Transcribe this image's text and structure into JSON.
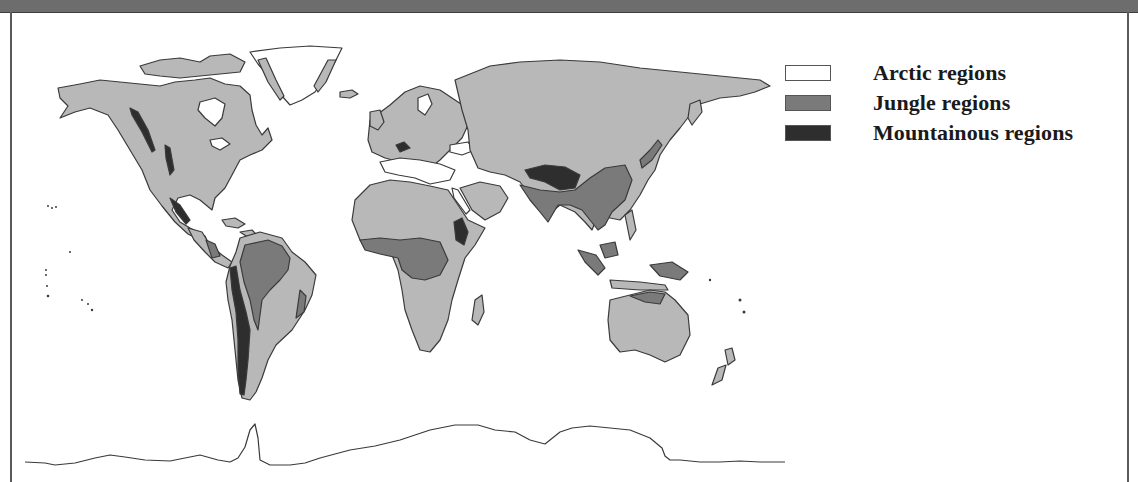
{
  "map": {
    "type": "world-climate-regions",
    "colors": {
      "land": "#b8b8b8",
      "arctic": "#ffffff",
      "jungle": "#7a7a7a",
      "mountain": "#2e2e2e",
      "outline": "#3a3a3a",
      "frame": "#6d6d6d"
    }
  },
  "legend": {
    "items": [
      {
        "label": "Arctic regions",
        "color": "#ffffff"
      },
      {
        "label": "Jungle regions",
        "color": "#7a7a7a"
      },
      {
        "label": "Mountainous regions",
        "color": "#2e2e2e"
      }
    ]
  }
}
